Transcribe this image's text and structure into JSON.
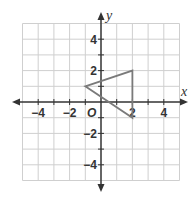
{
  "chart_data": {
    "type": "scatter",
    "title": "",
    "xlabel": "x",
    "ylabel": "y",
    "origin_label": "O",
    "xlim": [
      -5,
      5
    ],
    "ylim": [
      -5,
      5
    ],
    "grid": true,
    "x_tick_labels": [
      {
        "value": -4,
        "label": "−4"
      },
      {
        "value": -2,
        "label": "−2"
      },
      {
        "value": 2,
        "label": "2"
      },
      {
        "value": 4,
        "label": "4"
      }
    ],
    "y_tick_labels": [
      {
        "value": 4,
        "label": "4"
      },
      {
        "value": 2,
        "label": "2"
      },
      {
        "value": -2,
        "label": "−2"
      },
      {
        "value": -4,
        "label": "−4"
      }
    ],
    "series": [
      {
        "name": "triangle",
        "shape": "polygon",
        "points": [
          [
            -1,
            1
          ],
          [
            2,
            2
          ],
          [
            2,
            -1
          ]
        ],
        "color": "#7a7a7a"
      }
    ]
  },
  "colors": {
    "grid": "#cfcfcf",
    "axis": "#333333",
    "shape": "#7a7a7a"
  }
}
